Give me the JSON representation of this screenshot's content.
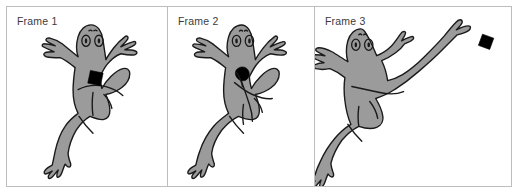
{
  "figure": {
    "border_color": "#bdbdbd",
    "background": "#ffffff",
    "panels": [
      {
        "label": "Frame 1",
        "subject": "frog",
        "fly_state": "on-chest",
        "fly_color": "#000000",
        "fly_shape": "square",
        "pose": "standing-arms-spread-fly-on-body"
      },
      {
        "label": "Frame 2",
        "subject": "frog",
        "fly_state": "at-mouth",
        "fly_color": "#000000",
        "fly_shape": "blob",
        "pose": "standing-arms-crossed-fly-near-mouth"
      },
      {
        "label": "Frame 3",
        "subject": "frog",
        "fly_state": "airborne-upper-right",
        "fly_color": "#000000",
        "fly_shape": "square",
        "pose": "leaping-arm-extended-toward-fly"
      }
    ]
  },
  "colors": {
    "frog_fill": "#9b9b9b",
    "outline": "#1a1a1a",
    "label_text": "#3b3b3b",
    "panel_background": "#ffffff",
    "frame_border": "#bdbdbd"
  }
}
